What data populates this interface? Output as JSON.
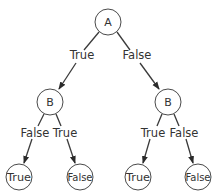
{
  "diagram": {
    "type": "decision-tree",
    "nodes": {
      "root": {
        "label": "A",
        "x": 108,
        "y": 22,
        "r": 13
      },
      "left": {
        "label": "B",
        "x": 50,
        "y": 102,
        "r": 13
      },
      "right": {
        "label": "B",
        "x": 168,
        "y": 102,
        "r": 13
      },
      "ll": {
        "label": "True",
        "x": 19,
        "y": 177,
        "r": 13
      },
      "lr": {
        "label": "False",
        "x": 80,
        "y": 177,
        "r": 13
      },
      "rl": {
        "label": "True",
        "x": 138,
        "y": 177,
        "r": 13
      },
      "rr": {
        "label": "False",
        "x": 198,
        "y": 177,
        "r": 13
      }
    },
    "edges": {
      "root_left": {
        "label": "True"
      },
      "root_right": {
        "label": "False"
      },
      "left_ll": {
        "label": "False"
      },
      "left_lr": {
        "label": "True"
      },
      "right_rl": {
        "label": "True"
      },
      "right_rr": {
        "label": "False"
      }
    },
    "colors": {
      "stroke": "#3a3a3a",
      "text": "#333333",
      "background": "#ffffff"
    }
  }
}
